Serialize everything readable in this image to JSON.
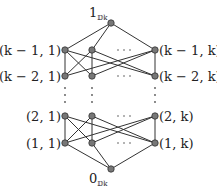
{
  "diagram": {
    "title": "",
    "top": {
      "main": "1",
      "sub": "𝔻k"
    },
    "bottom": {
      "main": "0",
      "sub": "𝔻k"
    },
    "rows": [
      {
        "left": "(k − 1, 1)",
        "right": "(k − 1, k)",
        "ellipsis": "· · ·"
      },
      {
        "left": "(k − 2, 1)",
        "right": "(k − 2, k)",
        "ellipsis": "· · ·"
      },
      {
        "left": "(2, 1)",
        "right": "(2, k)",
        "ellipsis": "· · ·"
      },
      {
        "left": "(1, 1)",
        "right": "(1, k)",
        "ellipsis": "· · ·"
      }
    ],
    "vertical_ellipsis": "⋮",
    "colors": {
      "node": "#777777",
      "edge": "#333333"
    }
  }
}
